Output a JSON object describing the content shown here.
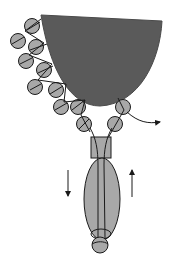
{
  "diagram": {
    "title": "",
    "colors": {
      "background": "#ffffff",
      "cup_fill": "#5a5a5a",
      "bead_fill": "#a8a8a8",
      "stroke": "#1a1a1a"
    },
    "cup": {
      "top_left": [
        41,
        15
      ],
      "top_right": [
        162,
        21
      ],
      "bottom": [
        100,
        106
      ]
    },
    "beads_left": [
      {
        "cx": 32,
        "cy": 26,
        "r": 7
      },
      {
        "cx": 18,
        "cy": 41,
        "r": 7
      },
      {
        "cx": 36,
        "cy": 47,
        "r": 7
      },
      {
        "cx": 26,
        "cy": 61,
        "r": 7
      },
      {
        "cx": 44,
        "cy": 70,
        "r": 7
      },
      {
        "cx": 35,
        "cy": 87,
        "r": 7
      },
      {
        "cx": 56,
        "cy": 90,
        "r": 7
      },
      {
        "cx": 61,
        "cy": 107,
        "r": 7
      },
      {
        "cx": 78,
        "cy": 107,
        "r": 7
      },
      {
        "cx": 84,
        "cy": 124,
        "r": 7
      }
    ],
    "beads_right": [
      {
        "cx": 123,
        "cy": 107,
        "r": 7
      },
      {
        "cx": 115,
        "cy": 124,
        "r": 7
      }
    ],
    "clasp": {
      "x": 91,
      "y": 137,
      "w": 20,
      "h": 21
    },
    "long_bead": {
      "cx": 102,
      "cy": 200,
      "rx": 18,
      "ry": 41
    },
    "end_bead": {
      "cx": 100,
      "cy": 245,
      "r": 8
    },
    "arrows": [
      {
        "name": "down-arrow",
        "x": 68,
        "y1": 170,
        "y2": 198,
        "direction": "down"
      },
      {
        "name": "up-arrow",
        "x": 132,
        "y1": 197,
        "y2": 168,
        "direction": "up"
      },
      {
        "name": "exit-arrow",
        "direction": "right",
        "from": [
          123,
          108
        ],
        "to": [
          162,
          122
        ]
      }
    ]
  }
}
